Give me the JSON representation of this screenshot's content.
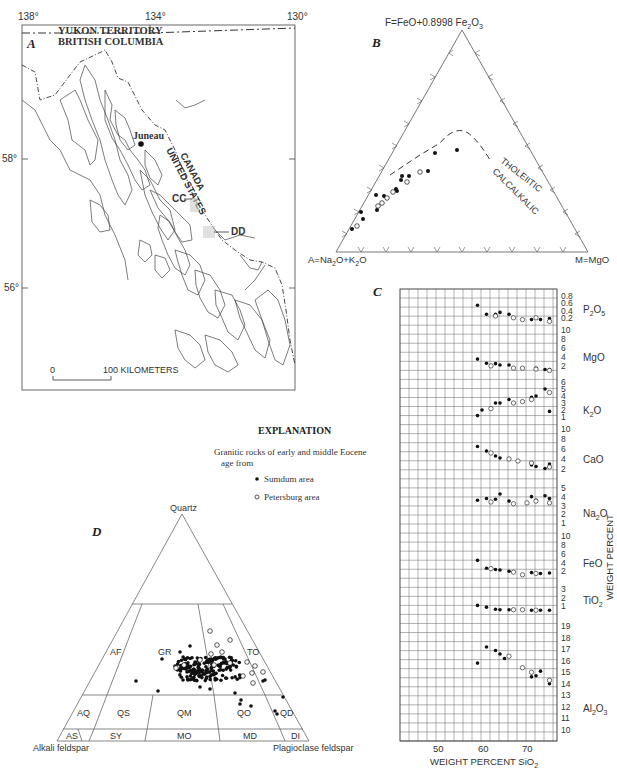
{
  "panels": {
    "a": {
      "letter": "A",
      "longitudes": [
        "138°",
        "134°",
        "130°"
      ],
      "latitudes": [
        "58°",
        "56°"
      ],
      "labels": {
        "yukon": "YUKON TERRITORY",
        "bc": "BRITISH COLUMBIA",
        "juneau": "Juneau",
        "canada": "CANADA",
        "us": "UNITED STATES",
        "cc": "CC",
        "dd": "DD"
      },
      "scale": {
        "zero": "0",
        "label": "100 KILOMETERS"
      }
    },
    "b": {
      "letter": "B",
      "apex_top": "F=FeO+0.8998 Fe2O3",
      "apex_left": "A=Na2O+K2O",
      "apex_right": "M=MgO",
      "line_label_upper": "THOLEIITIC",
      "line_label_lower": "CALCALKALIC"
    },
    "c": {
      "letter": "C",
      "xlabel": "WEIGHT PERCENT SiO2",
      "ylabel": "WEIGHT PERCENT",
      "x_ticks": [
        "50",
        "60",
        "70"
      ]
    },
    "d": {
      "letter": "D",
      "apex_top": "Quartz",
      "apex_left": "Alkali feldspar",
      "apex_right": "Plagioclase feldspar",
      "fields": [
        "AF",
        "GR",
        "TO",
        "AQ",
        "QS",
        "QM",
        "QO",
        "QD",
        "AS",
        "SY",
        "MO",
        "MD",
        "DI"
      ]
    }
  },
  "explanation": {
    "title": "EXPLANATION",
    "text_line1": "Granitic rocks of early and middle Eocene",
    "text_line2": "age from",
    "legend": [
      {
        "symbol": "filled-circle",
        "label": "Sumdum area"
      },
      {
        "symbol": "open-circle",
        "label": "Petersburg area"
      }
    ]
  },
  "chart_data": [
    {
      "type": "scatter",
      "title": "B — AFM diagram",
      "plot": "ternary",
      "apices": {
        "top": "F=FeO+0.8998 Fe2O3",
        "left": "A=Na2O+K2O",
        "right": "M=MgO"
      },
      "annotations": [
        "THOLEIITIC",
        "CALCALKALIC"
      ],
      "boundary": "dashed line separating tholeiitic (above) from calcalkalic (below) fields",
      "series": [
        {
          "name": "Sumdum area",
          "marker": "filled",
          "points_AFM_pct": [
            [
              80,
              17,
              3
            ],
            [
              77,
              20,
              3
            ],
            [
              74,
              23,
              3
            ],
            [
              70,
              26,
              4
            ],
            [
              68,
              26,
              6
            ],
            [
              66,
              28,
              6
            ],
            [
              64,
              30,
              6
            ],
            [
              62,
              31,
              7
            ],
            [
              60,
              32,
              8
            ],
            [
              56,
              34,
              10
            ],
            [
              48,
              40,
              12
            ],
            [
              42,
              44,
              14
            ]
          ]
        },
        {
          "name": "Petersburg area",
          "marker": "open",
          "points_AFM_pct": [
            [
              78,
              19,
              3
            ],
            [
              72,
              24,
              4
            ],
            [
              70,
              25,
              5
            ],
            [
              66,
              28,
              6
            ],
            [
              60,
              31,
              9
            ],
            [
              55,
              33,
              12
            ]
          ]
        }
      ]
    },
    {
      "type": "scatter",
      "title": "C — Harker variation diagrams",
      "xlabel": "WEIGHT PERCENT SiO2",
      "ylabel": "WEIGHT PERCENT",
      "x_ticks": [
        50,
        60,
        70
      ],
      "xlim": [
        42,
        77
      ],
      "grid": true,
      "subplots": [
        {
          "oxide": "P2O5",
          "y_ticks": [
            0.2,
            0.4,
            0.6,
            0.8
          ],
          "sumdum": [
            [
              59,
              0.55
            ],
            [
              61,
              0.3
            ],
            [
              63,
              0.3
            ],
            [
              64,
              0.35
            ],
            [
              66,
              0.3
            ],
            [
              71,
              0.15
            ],
            [
              73,
              0.15
            ],
            [
              75,
              0.18
            ]
          ],
          "petersburg": [
            [
              63,
              0.25
            ],
            [
              67,
              0.2
            ],
            [
              69,
              0.15
            ],
            [
              72,
              0.2
            ],
            [
              75,
              0.1
            ]
          ]
        },
        {
          "oxide": "MgO",
          "y_ticks": [
            2,
            4,
            6,
            8,
            10
          ],
          "sumdum": [
            [
              59,
              3.5
            ],
            [
              61,
              2.6
            ],
            [
              63,
              2.5
            ],
            [
              64,
              2.2
            ],
            [
              66,
              2.2
            ],
            [
              72,
              1.5
            ],
            [
              74,
              1.2
            ],
            [
              75,
              1.2
            ]
          ],
          "petersburg": [
            [
              62,
              2.0
            ],
            [
              67,
              1.5
            ],
            [
              69,
              1.5
            ],
            [
              72,
              1.3
            ],
            [
              75,
              1.0
            ]
          ]
        },
        {
          "oxide": "K2O",
          "y_ticks": [
            1,
            2,
            3,
            4,
            5,
            6
          ],
          "sumdum": [
            [
              59,
              1.2
            ],
            [
              60,
              2.0
            ],
            [
              63,
              3.0
            ],
            [
              64,
              3.0
            ],
            [
              66,
              3.5
            ],
            [
              71,
              3.8
            ],
            [
              72,
              4.0
            ],
            [
              74,
              5.0
            ],
            [
              75,
              1.8
            ]
          ],
          "petersburg": [
            [
              62,
              2.2
            ],
            [
              67,
              3.0
            ],
            [
              69,
              3.2
            ],
            [
              71,
              3.5
            ],
            [
              75,
              4.5
            ]
          ]
        },
        {
          "oxide": "CaO",
          "y_ticks": [
            2,
            4,
            6,
            8,
            10
          ],
          "sumdum": [
            [
              59,
              6.5
            ],
            [
              61,
              5.6
            ],
            [
              63,
              4.6
            ],
            [
              64,
              4.2
            ],
            [
              66,
              4.1
            ],
            [
              71,
              2.8
            ],
            [
              72,
              2.5
            ],
            [
              74,
              2.1
            ],
            [
              75,
              3.0
            ]
          ],
          "petersburg": [
            [
              62,
              5.2
            ],
            [
              66,
              4.0
            ],
            [
              68,
              3.6
            ],
            [
              71,
              3.2
            ],
            [
              75,
              2.4
            ]
          ]
        },
        {
          "oxide": "Na2O",
          "y_ticks": [
            1,
            2,
            3,
            4,
            5
          ],
          "sumdum": [
            [
              59,
              3.6
            ],
            [
              61,
              3.8
            ],
            [
              63,
              3.7
            ],
            [
              64,
              4.3
            ],
            [
              66,
              3.5
            ],
            [
              71,
              4.0
            ],
            [
              72,
              3.6
            ],
            [
              74,
              4.1
            ],
            [
              75,
              3.8
            ]
          ],
          "petersburg": [
            [
              62,
              3.4
            ],
            [
              67,
              3.2
            ],
            [
              70,
              3.3
            ],
            [
              72,
              3.5
            ],
            [
              75,
              3.3
            ]
          ]
        },
        {
          "oxide": "FeO",
          "y_ticks": [
            2,
            4,
            6,
            8,
            10
          ],
          "sumdum": [
            [
              59,
              4.5
            ],
            [
              61,
              2.7
            ],
            [
              63,
              2.4
            ],
            [
              64,
              2.3
            ],
            [
              66,
              2.0
            ],
            [
              71,
              1.7
            ],
            [
              73,
              1.5
            ],
            [
              75,
              1.6
            ]
          ],
          "petersburg": [
            [
              62,
              2.6
            ],
            [
              67,
              1.8
            ],
            [
              69,
              1.2
            ],
            [
              72,
              1.5
            ]
          ]
        },
        {
          "oxide": "TiO2",
          "y_ticks": [
            1,
            2,
            3
          ],
          "sumdum": [
            [
              59,
              1.1
            ],
            [
              61,
              0.9
            ],
            [
              63,
              0.65
            ],
            [
              64,
              0.6
            ],
            [
              66,
              0.6
            ],
            [
              71,
              0.55
            ],
            [
              73,
              0.55
            ],
            [
              75,
              0.55
            ]
          ],
          "petersburg": [
            [
              67,
              0.6
            ],
            [
              69,
              0.6
            ],
            [
              72,
              0.55
            ]
          ]
        },
        {
          "oxide": "Al2O3",
          "y_ticks": [
            10,
            11,
            12,
            13,
            14,
            15,
            16,
            17,
            18,
            19
          ],
          "sumdum": [
            [
              59,
              15.8
            ],
            [
              61,
              17.2
            ],
            [
              63,
              16.9
            ],
            [
              64,
              16.6
            ],
            [
              65,
              16.2
            ],
            [
              71,
              14.6
            ],
            [
              72,
              14.7
            ],
            [
              73,
              15.1
            ],
            [
              75,
              14.0
            ]
          ],
          "petersburg": [
            [
              66,
              16.4
            ],
            [
              69,
              15.4
            ],
            [
              71,
              15.0
            ],
            [
              75,
              14.3
            ]
          ]
        }
      ]
    },
    {
      "type": "scatter",
      "title": "D — QAP modal classification",
      "plot": "ternary",
      "apices": {
        "top": "Quartz",
        "left": "Alkali feldspar",
        "right": "Plagioclase feldspar"
      },
      "field_labels": [
        "AF",
        "GR",
        "TO",
        "AQ",
        "QS",
        "QM",
        "QO",
        "QD",
        "AS",
        "SY",
        "MO",
        "MD",
        "DI"
      ],
      "series": [
        {
          "name": "Sumdum area",
          "marker": "filled",
          "description": "dense cluster mostly in GR/TO fields near Q≈25-35%, plag/(alk+plag)≈0.6-0.8; few points in QO, QD, DI"
        },
        {
          "name": "Petersburg area",
          "marker": "open",
          "description": "points within GR/TO cluster, Q≈25-40%"
        }
      ]
    }
  ]
}
